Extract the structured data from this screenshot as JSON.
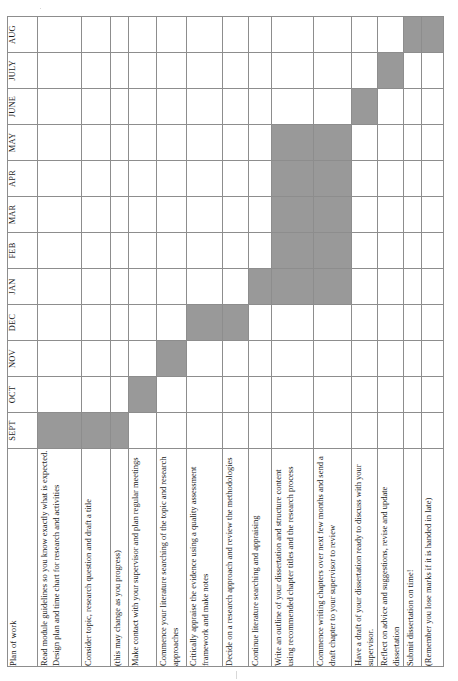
{
  "document": {
    "kind": "gantt-chart",
    "orientation": "rotated-90-ccw",
    "plan_header": "Plan of work",
    "bar_color": "#999999",
    "grid_color": "#8d8d8d",
    "page_background": "#ffffff"
  },
  "months": [
    "SEPT",
    "OCT",
    "NOV",
    "DEC",
    "JAN",
    "FEB",
    "MAR",
    "APR",
    "MAY",
    "JUNE",
    "JULY",
    "AUG"
  ],
  "tasks": [
    {
      "label": "Read module guidelines so you know exactly what is expected.  Design plan and time chart for research and activities"
    },
    {
      "label": "Consider topic, research question and draft a title"
    },
    {
      "label": "(this may change as you progress)"
    },
    {
      "label": "Make contact with your supervisor and plan regular meetings"
    },
    {
      "label": "Commence your literature searching of the topic and research approaches"
    },
    {
      "label": "Critically appraise the evidence using a quality assessment framework and make notes"
    },
    {
      "label": "Decide on a research approach and review the methodologies"
    },
    {
      "label": "Continue literature searching and appraising"
    },
    {
      "label": "Write an outline of your dissertation and structure content using recommended chapter titles and the research process"
    },
    {
      "label": "Commence writing chapters over next few months and send a draft chapter to your supervisor to review"
    },
    {
      "label": "Have a draft of your dissertation ready to discuss with your supervisor."
    },
    {
      "label": "Reflect on advice and suggestions, revise and update dissertation"
    },
    {
      "label": "Submit dissertation on time!"
    },
    {
      "label": "(Remember you lose marks if it is handed in late)"
    }
  ],
  "chart_data": {
    "type": "gantt",
    "title": "Plan of work",
    "xlabel": "Month",
    "ylabel": "Plan of work",
    "categories": [
      "SEPT",
      "OCT",
      "NOV",
      "DEC",
      "JAN",
      "FEB",
      "MAR",
      "APR",
      "MAY",
      "JUNE",
      "JULY",
      "AUG"
    ],
    "rows": [
      {
        "task": "Read module guidelines so you know exactly what is expected.  Design plan and time chart for research and activities",
        "months": [
          "SEPT"
        ],
        "cells": [
          1,
          0,
          0,
          0,
          0,
          0,
          0,
          0,
          0,
          0,
          0,
          0
        ]
      },
      {
        "task": "Consider topic, research question and draft a title",
        "months": [
          "SEPT"
        ],
        "cells": [
          1,
          0,
          0,
          0,
          0,
          0,
          0,
          0,
          0,
          0,
          0,
          0
        ]
      },
      {
        "task": "(this may change as you progress)",
        "months": [
          "SEPT"
        ],
        "cells": [
          1,
          0,
          0,
          0,
          0,
          0,
          0,
          0,
          0,
          0,
          0,
          0
        ]
      },
      {
        "task": "Make contact with your supervisor and plan regular meetings",
        "months": [
          "OCT"
        ],
        "cells": [
          0,
          1,
          0,
          0,
          0,
          0,
          0,
          0,
          0,
          0,
          0,
          0
        ]
      },
      {
        "task": "Commence your literature searching of the topic and research approaches",
        "months": [
          "NOV"
        ],
        "cells": [
          0,
          0,
          1,
          0,
          0,
          0,
          0,
          0,
          0,
          0,
          0,
          0
        ]
      },
      {
        "task": "Critically appraise the evidence using a quality assessment framework and make notes",
        "months": [
          "DEC"
        ],
        "cells": [
          0,
          0,
          0,
          1,
          0,
          0,
          0,
          0,
          0,
          0,
          0,
          0
        ]
      },
      {
        "task": "Decide on a research approach and review the methodologies",
        "months": [
          "DEC"
        ],
        "cells": [
          0,
          0,
          0,
          1,
          0,
          0,
          0,
          0,
          0,
          0,
          0,
          0
        ]
      },
      {
        "task": "Continue literature searching and appraising",
        "months": [
          "JAN"
        ],
        "cells": [
          0,
          0,
          0,
          0,
          1,
          0,
          0,
          0,
          0,
          0,
          0,
          0
        ]
      },
      {
        "task": "Write an outline of your dissertation and structure content using recommended chapter titles and the research process",
        "months": [
          "JAN",
          "FEB",
          "MAR",
          "APR",
          "MAY"
        ],
        "cells": [
          0,
          0,
          0,
          0,
          1,
          1,
          1,
          1,
          1,
          0,
          0,
          0
        ]
      },
      {
        "task": "Commence writing chapters over next few months and send a draft chapter to your supervisor to review",
        "months": [
          "JAN",
          "FEB",
          "MAR",
          "APR",
          "MAY"
        ],
        "cells": [
          0,
          0,
          0,
          0,
          1,
          1,
          1,
          1,
          1,
          0,
          0,
          0
        ]
      },
      {
        "task": "Have a draft of your dissertation ready to discuss with your supervisor.",
        "months": [
          "JUNE"
        ],
        "cells": [
          0,
          0,
          0,
          0,
          0,
          0,
          0,
          0,
          0,
          1,
          0,
          0
        ]
      },
      {
        "task": "Reflect on advice and suggestions, revise and update dissertation",
        "months": [
          "JULY"
        ],
        "cells": [
          0,
          0,
          0,
          0,
          0,
          0,
          0,
          0,
          0,
          0,
          1,
          0
        ]
      },
      {
        "task": "Submit dissertation on time!",
        "months": [
          "AUG"
        ],
        "cells": [
          0,
          0,
          0,
          0,
          0,
          0,
          0,
          0,
          0,
          0,
          0,
          1
        ]
      },
      {
        "task": "(Remember you lose marks if it is handed in late)",
        "months": [
          "AUG"
        ],
        "cells": [
          0,
          0,
          0,
          0,
          0,
          0,
          0,
          0,
          0,
          0,
          0,
          1
        ]
      }
    ],
    "grid": true,
    "legend": null
  }
}
